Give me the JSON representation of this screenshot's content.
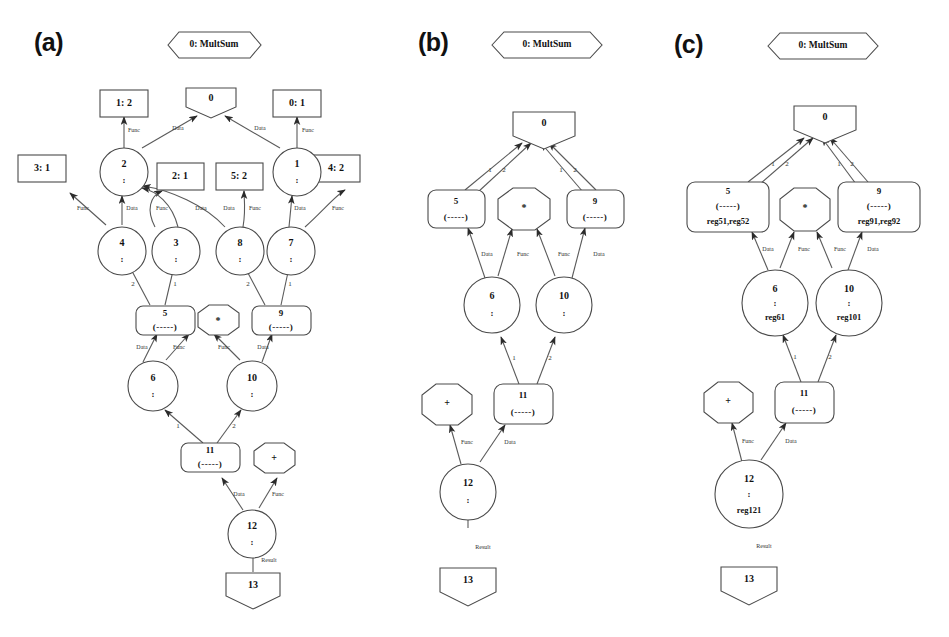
{
  "figure": {
    "background": "#ffffff",
    "stroke_color": "#4a4a4a",
    "text_color": "#111111",
    "panels": [
      {
        "id": "a",
        "label": "(a)",
        "header": "0: MultSum",
        "nodes": {
          "root": "0",
          "rect_top_left": "1: 2",
          "rect_top_right": "0: 1",
          "rect_mid_far_left": "3: 1",
          "rect_mid_left": "2: 1",
          "rect_mid_right": "5: 2",
          "rect_mid_far_right": "4: 2",
          "circle_2": "2",
          "circle_1": "1",
          "circle_4": "4",
          "circle_3": "3",
          "circle_8": "8",
          "circle_7": "7",
          "box_5": "5",
          "box_5_sub": "(-----)",
          "box_9": "9",
          "box_9_sub": "(-----)",
          "oct_mult": "*",
          "circle_6": "6",
          "circle_10": "10",
          "box_11": "11",
          "box_11_sub": "(-----)",
          "oct_plus": "+",
          "circle_12": "12",
          "pent_13": "13",
          "colon": ":"
        },
        "edge_labels": {
          "func": "Func",
          "data": "Data",
          "result": "Result",
          "one": "1",
          "two": "2"
        }
      },
      {
        "id": "b",
        "label": "(b)",
        "header": "0: MultSum",
        "nodes": {
          "root": "0",
          "box_5": "5",
          "box_5_sub": "(-----)",
          "box_9": "9",
          "box_9_sub": "(-----)",
          "oct_mult": "*",
          "circle_6": "6",
          "circle_10": "10",
          "box_11": "11",
          "box_11_sub": "(-----)",
          "oct_plus": "+",
          "circle_12": "12",
          "pent_13": "13",
          "colon": ":"
        },
        "edge_labels": {
          "func": "Func",
          "data": "Data",
          "result": "Result",
          "one": "1",
          "two": "2"
        }
      },
      {
        "id": "c",
        "label": "(c)",
        "header": "0: MultSum",
        "nodes": {
          "root": "0",
          "box_5": "5",
          "box_5_sub": "(-----)",
          "box_5_reg": "reg51,reg52",
          "box_9": "9",
          "box_9_sub": "(-----)",
          "box_9_reg": "reg91,reg92",
          "oct_mult": "*",
          "circle_6": "6",
          "circle_6_reg": "reg61",
          "circle_10": "10",
          "circle_10_reg": "reg101",
          "box_11": "11",
          "box_11_sub": "(-----)",
          "oct_plus": "+",
          "circle_12": "12",
          "circle_12_reg": "reg121",
          "pent_13": "13",
          "colon": ":"
        },
        "edge_labels": {
          "func": "Func",
          "data": "Data",
          "result": "Result",
          "one": "1",
          "two": "2"
        }
      }
    ]
  }
}
